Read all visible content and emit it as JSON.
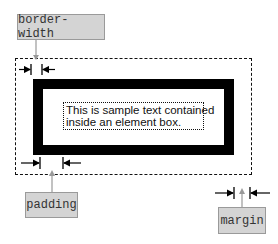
{
  "diagram": {
    "labels": {
      "border_width": "border-width",
      "padding": "padding",
      "margin": "margin"
    },
    "content_text": {
      "line1": "This is sample text contained",
      "line2": "inside an element box."
    },
    "colors": {
      "label_fill": "#d4d4d4",
      "label_border": "#9a9a9a",
      "pointer_arrow": "#999999",
      "border": "#000000"
    }
  }
}
